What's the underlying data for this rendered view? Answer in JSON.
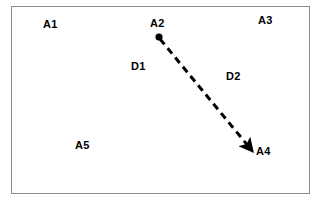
{
  "diagram": {
    "title": "",
    "frame": {
      "border_color": "#8c8c8c",
      "background_color": "#ffffff"
    },
    "stroke_color": "#000000",
    "nodes": [
      {
        "id": "A1",
        "label": "A1",
        "x": 43,
        "y": 19,
        "has_dot": false
      },
      {
        "id": "A2",
        "label": "A2",
        "x": 150,
        "y": 18,
        "has_dot": true,
        "dot_x": 159,
        "dot_y": 37
      },
      {
        "id": "A3",
        "label": "A3",
        "x": 258,
        "y": 15,
        "has_dot": false
      },
      {
        "id": "A5",
        "label": "A5",
        "x": 75,
        "y": 140,
        "has_dot": false
      },
      {
        "id": "A4",
        "label": "A4",
        "x": 256,
        "y": 146,
        "has_dot": false
      }
    ],
    "edges": [
      {
        "id": "D1-D2",
        "from": "A2",
        "to": "A4",
        "style": "dashed",
        "arrowhead": "end",
        "x1": 160,
        "y1": 39,
        "x2": 249,
        "y2": 147,
        "stroke_width": 3,
        "dash": "7 5"
      }
    ],
    "edge_labels": [
      {
        "id": "D1",
        "label": "D1",
        "x": 131,
        "y": 61
      },
      {
        "id": "D2",
        "label": "D2",
        "x": 226,
        "y": 71
      }
    ]
  }
}
